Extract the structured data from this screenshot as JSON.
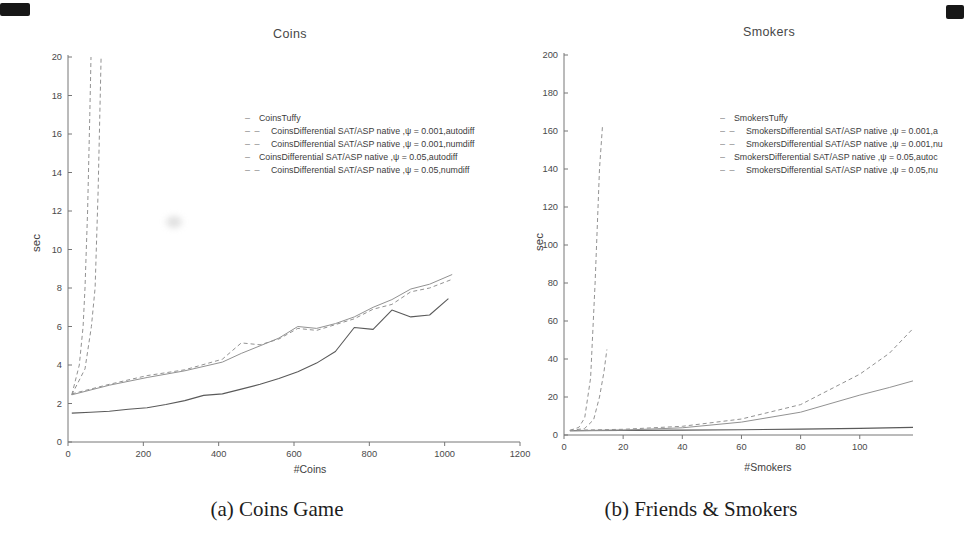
{
  "figure": {
    "caption_a": "(a) Coins Game",
    "caption_b": "(b) Friends & Smokers"
  },
  "colors": {
    "text": "#3c3c3c",
    "axis": "#767676",
    "tick_label": "#4a4a4a",
    "line_dark": "#5a5a5a",
    "line_light": "#929292",
    "corner_mark": "#171717"
  },
  "chart_data": [
    {
      "type": "line",
      "title": "Coins",
      "xlabel": "#Coins",
      "ylabel": "sec",
      "xlim": [
        0,
        1200
      ],
      "ylim": [
        0,
        20
      ],
      "xticks": [
        0,
        200,
        400,
        600,
        800,
        1000,
        1200
      ],
      "yticks": [
        0,
        2,
        4,
        6,
        8,
        10,
        12,
        14,
        16,
        18,
        20
      ],
      "grid": false,
      "legend_position": "upper-right-inside",
      "series": [
        {
          "name": "CoinsTuffy",
          "style": "solid",
          "tone": "dark",
          "x": [
            10,
            60,
            110,
            160,
            210,
            260,
            310,
            360,
            410,
            460,
            510,
            560,
            610,
            660,
            710,
            760,
            810,
            860,
            910,
            960,
            1010
          ],
          "y": [
            1.5,
            1.55,
            1.6,
            1.7,
            1.78,
            1.95,
            2.15,
            2.42,
            2.5,
            2.75,
            3.0,
            3.3,
            3.65,
            4.1,
            4.7,
            5.95,
            5.85,
            6.85,
            6.5,
            6.6,
            7.45
          ]
        },
        {
          "name": "CoinsDifferential SAT/ASP native ,ψ = 0.001,autodiff",
          "style": "dashed",
          "tone": "light",
          "x": [
            10,
            30,
            40,
            45,
            52,
            58,
            61
          ],
          "y": [
            2.45,
            4.0,
            6.0,
            8.0,
            12.0,
            17.0,
            20.0
          ]
        },
        {
          "name": "CoinsDifferential SAT/ASP native ,ψ = 0.001,numdiff",
          "style": "dashed",
          "tone": "light",
          "x": [
            10,
            45,
            62,
            72,
            80,
            88
          ],
          "y": [
            2.45,
            3.8,
            6.0,
            8.0,
            13.0,
            20.0
          ]
        },
        {
          "name": "CoinsDifferential SAT/ASP native ,ψ = 0.05,autodiff",
          "style": "solid",
          "tone": "light",
          "x": [
            10,
            110,
            210,
            310,
            410,
            460,
            510,
            560,
            610,
            660,
            710,
            760,
            810,
            860,
            910,
            960,
            1020
          ],
          "y": [
            2.45,
            2.95,
            3.35,
            3.7,
            4.15,
            4.6,
            5.0,
            5.4,
            6.0,
            5.9,
            6.15,
            6.5,
            7.0,
            7.4,
            7.95,
            8.2,
            8.7
          ]
        },
        {
          "name": "CoinsDifferential SAT/ASP native ,ψ = 0.05,numdiff",
          "style": "dashed",
          "tone": "light",
          "x": [
            10,
            110,
            210,
            310,
            410,
            460,
            510,
            560,
            610,
            660,
            710,
            760,
            810,
            860,
            910,
            960,
            1020
          ],
          "y": [
            2.5,
            3.0,
            3.45,
            3.75,
            4.3,
            5.15,
            5.05,
            5.35,
            5.9,
            5.8,
            6.1,
            6.4,
            6.9,
            7.15,
            7.8,
            8.0,
            8.45
          ]
        }
      ]
    },
    {
      "type": "line",
      "title": "Smokers",
      "xlabel": "#Smokers",
      "ylabel": "sec",
      "xlim": [
        0,
        118
      ],
      "ylim": [
        0,
        200
      ],
      "xticks": [
        0,
        20,
        40,
        60,
        80,
        100
      ],
      "yticks": [
        0,
        20,
        40,
        60,
        80,
        100,
        120,
        140,
        160,
        180,
        200
      ],
      "grid": false,
      "legend_position": "upper-right-inside-clipped",
      "series": [
        {
          "name": "SmokersTuffy",
          "style": "solid",
          "tone": "dark",
          "x": [
            2,
            20,
            40,
            60,
            80,
            100,
            118
          ],
          "y": [
            2.3,
            2.4,
            2.6,
            2.8,
            3.1,
            3.5,
            4.0
          ]
        },
        {
          "name": "SmokersDifferential SAT/ASP native ,ψ = 0.001,a",
          "style": "dashed",
          "tone": "light",
          "x": [
            2,
            5,
            7,
            9,
            10.5,
            12,
            13
          ],
          "y": [
            2.5,
            4.0,
            9.0,
            30.0,
            80.0,
            140.0,
            162.0
          ]
        },
        {
          "name": "SmokersDifferential SAT/ASP native ,ψ = 0.001,nu",
          "style": "dashed",
          "tone": "light",
          "x": [
            2,
            7,
            10,
            12,
            13.5,
            14.5
          ],
          "y": [
            2.3,
            3.5,
            8.0,
            20.0,
            33.0,
            45.0
          ]
        },
        {
          "name": "SmokersDifferential SAT/ASP native ,ψ = 0.05,autoc",
          "style": "solid",
          "tone": "light",
          "x": [
            2,
            20,
            40,
            60,
            80,
            100,
            110,
            118
          ],
          "y": [
            2.2,
            2.6,
            3.8,
            6.8,
            12.0,
            21.0,
            25.0,
            28.5
          ]
        },
        {
          "name": "SmokersDifferential SAT/ASP native ,ψ = 0.05,nu",
          "style": "dashed",
          "tone": "light",
          "x": [
            2,
            20,
            40,
            60,
            80,
            100,
            110,
            118
          ],
          "y": [
            2.5,
            3.0,
            4.6,
            8.4,
            16.0,
            32.0,
            43.0,
            56.0
          ]
        }
      ]
    }
  ]
}
